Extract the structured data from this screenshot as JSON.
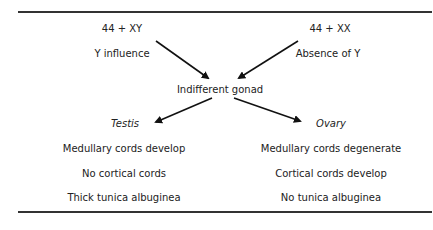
{
  "diagram": {
    "top_left": {
      "karyotype": "44 + XY",
      "influence": "Y influence"
    },
    "top_right": {
      "karyotype": "44 + XX",
      "influence": "Absence of Y"
    },
    "center": "Indifferent gonad",
    "left_branch": {
      "title": "Testis",
      "features": [
        "Medullary cords develop",
        "No cortical cords",
        "Thick tunica albuginea"
      ]
    },
    "right_branch": {
      "title": "Ovary",
      "features": [
        "Medullary cords degenerate",
        "Cortical cords develop",
        "No tunica albuginea"
      ]
    }
  }
}
